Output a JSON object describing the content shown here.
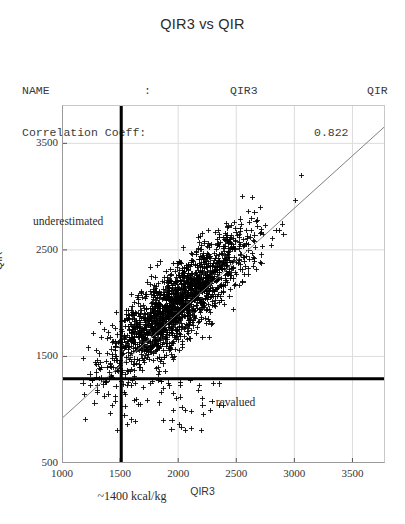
{
  "title": "QIR3 vs QIR",
  "header": {
    "row1_label": "NAME",
    "row1_colon": ":",
    "row1_value1": "QIR3",
    "row1_value2": "QIR",
    "row2_label": "Correlation Coeff:",
    "row2_value": "0.822"
  },
  "annotations": {
    "underestimated": "underestimated",
    "revalued": "revalued",
    "threshold_note": "~1400 kcal/kg"
  },
  "chart_data": {
    "type": "scatter",
    "title": "QIR3 vs QIR",
    "xlabel": "QIR3",
    "ylabel": "QIR",
    "xlim": [
      1000,
      3780
    ],
    "ylim": [
      500,
      3860
    ],
    "xticks": [
      1000,
      1500,
      2000,
      2500,
      3000,
      3500
    ],
    "yticks": [
      500,
      1500,
      2500,
      3500
    ],
    "grid": true,
    "legend": false,
    "marker": "plus",
    "marker_color": "#000000",
    "correlation_coefficient": 0.822,
    "n_points": 1750,
    "cloud": {
      "x_mean": 2000,
      "y_mean": 2000,
      "x_sd": 300,
      "y_sd": 330,
      "rho": 0.822,
      "x_min": 1180,
      "y_min": 760
    },
    "fit_line": {
      "label": "regression line",
      "color": "#808080",
      "x_start": 1000,
      "y_start": 920,
      "x_end": 3780,
      "y_end": 3660
    },
    "reference_lines": [
      {
        "name": "vertical-threshold",
        "orientation": "vertical",
        "value": 1510,
        "color": "#000000",
        "width": 3,
        "note": "~1400 kcal/kg"
      },
      {
        "name": "horizontal-threshold",
        "orientation": "horizontal",
        "value": 1290,
        "color": "#000000",
        "width": 3
      }
    ],
    "regions": [
      {
        "name": "underestimated",
        "label": "underestimated",
        "x": 1130,
        "y": 2760
      },
      {
        "name": "revalued",
        "label": "revalued",
        "x": 2530,
        "y": 1060
      }
    ]
  }
}
